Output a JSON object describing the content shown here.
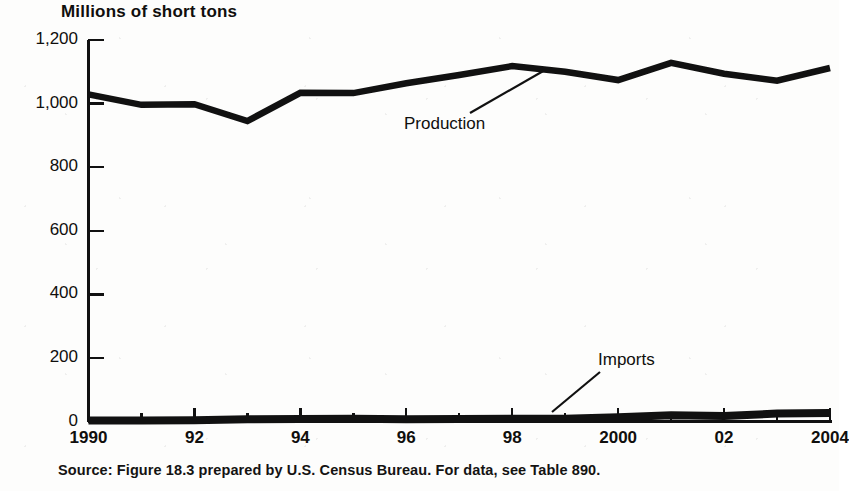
{
  "figure": {
    "title": "Millions of short tons",
    "source_note": "Source: Figure 18.3 prepared by U.S. Census Bureau.  For data, see Table 890."
  },
  "annotations": {
    "production_label": "Production",
    "imports_label": "Imports"
  },
  "axes": {
    "y_tick_labels": [
      "1,200",
      "1,000",
      "800",
      "600",
      "400",
      "200",
      "0"
    ],
    "x_tick_labels": [
      "1990",
      "92",
      "94",
      "96",
      "98",
      "2000",
      "02",
      "2004"
    ]
  },
  "colors": {
    "ink": "#100f0d",
    "paper": "#fdfdfc",
    "series_line": "#111111"
  },
  "chart_data": {
    "type": "line",
    "title": "Millions of short tons",
    "xlabel": "",
    "ylabel": "Millions of short tons",
    "ylim": [
      0,
      1200
    ],
    "yticks": [
      0,
      200,
      400,
      600,
      800,
      1000,
      1200
    ],
    "ytick_labels": [
      "0",
      "200",
      "400",
      "600",
      "800",
      "1,000",
      "1,200"
    ],
    "xlim": [
      1990,
      2004
    ],
    "xticks": [
      1990,
      1992,
      1994,
      1996,
      1998,
      2000,
      2002,
      2004
    ],
    "xtick_labels": [
      "1990",
      "92",
      "94",
      "96",
      "98",
      "2000",
      "02",
      "2004"
    ],
    "minor_xticks": [
      1991,
      1993,
      1995,
      1997,
      1999,
      2001,
      2003
    ],
    "grid": false,
    "legend": "none",
    "annotations": [
      {
        "text": "Production",
        "series": "Production",
        "x": 1998.0,
        "y": 1103,
        "label_x": 1996.1,
        "label_y": 975
      },
      {
        "text": "Imports",
        "series": "Imports",
        "x": 1998.6,
        "y": 12,
        "label_x": 2000.2,
        "label_y": 225
      }
    ],
    "x": [
      1990,
      1991,
      1992,
      1993,
      1994,
      1995,
      1996,
      1997,
      1998,
      1999,
      2000,
      2001,
      2002,
      2003,
      2004
    ],
    "series": [
      {
        "name": "Production",
        "values": [
          1029,
          996,
          998,
          945,
          1034,
          1033,
          1064,
          1090,
          1118,
          1100,
          1074,
          1128,
          1094,
          1072,
          1112
        ]
      },
      {
        "name": "Imports",
        "values": [
          3,
          3,
          4,
          7,
          8,
          9,
          7,
          8,
          9,
          9,
          13,
          20,
          17,
          25,
          27
        ]
      }
    ]
  }
}
